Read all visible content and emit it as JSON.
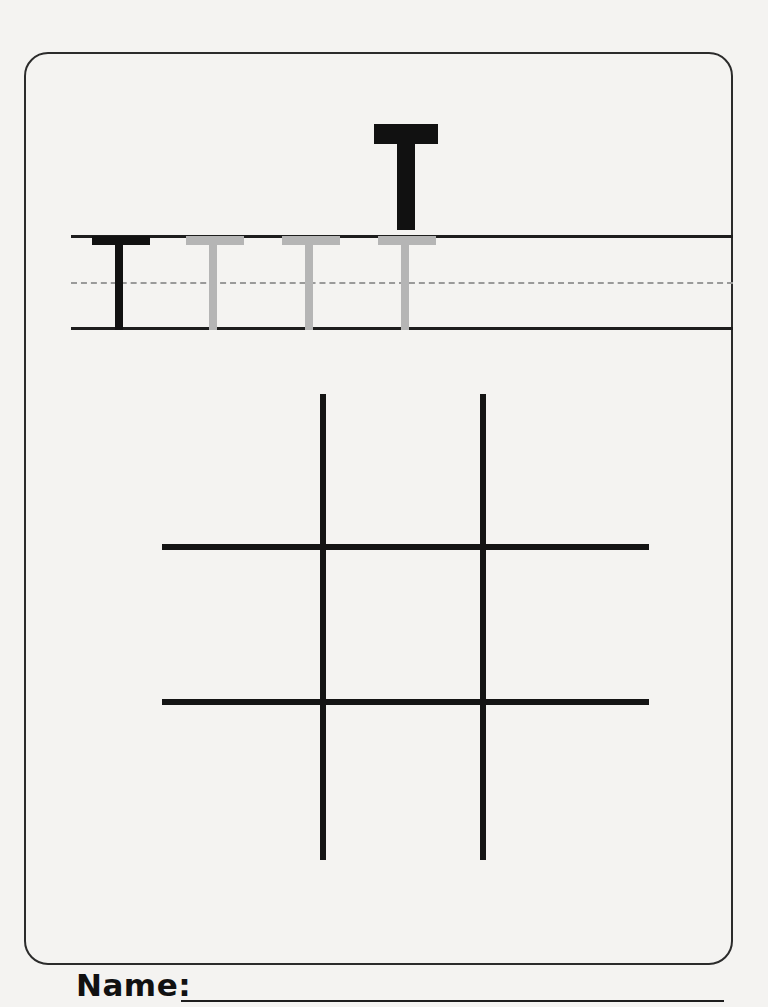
{
  "worksheet": {
    "type": "handwriting-tracing-worksheet",
    "letter": "T",
    "letter_case": "uppercase",
    "model_letter": {
      "glyph": "T",
      "color": "#111111"
    },
    "tracing_row": {
      "guide_lines": {
        "top_line_color": "#1d1d1d",
        "midline_style": "dashed",
        "midline_color": "#9a9a9a",
        "baseline_color": "#1d1d1d"
      },
      "letters": [
        {
          "glyph": "T",
          "style": "solid",
          "color": "#111111",
          "label": "example-letter"
        },
        {
          "glyph": "T",
          "style": "ghost",
          "color": "#b5b5b5",
          "label": "trace-letter-1"
        },
        {
          "glyph": "T",
          "style": "ghost",
          "color": "#b5b5b5",
          "label": "trace-letter-2"
        },
        {
          "glyph": "T",
          "style": "ghost",
          "color": "#b5b5b5",
          "label": "trace-letter-3"
        }
      ]
    },
    "practice_grid": {
      "rows": 3,
      "columns": 3,
      "line_color": "#141414",
      "description": "blank nine-box practice grid"
    },
    "footer": {
      "name_label": "Name:",
      "name_value": "",
      "name_placeholder": ""
    },
    "colors": {
      "page_background": "#f4f3f1",
      "card_border": "#2b2b2b",
      "ink": "#111111",
      "ghost_ink": "#b5b5b5"
    }
  }
}
